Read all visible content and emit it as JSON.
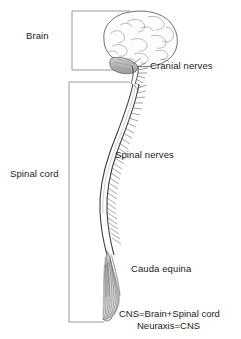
{
  "figure": {
    "background_color": "#ffffff",
    "ink_color": "#1b1b1b",
    "width": 241,
    "height": 339
  },
  "labels": {
    "brain": "Brain",
    "cranial_nerves": "Cranial nerves",
    "spinal_cord": "Spinal cord",
    "spinal_nerves": "Spinal nerves",
    "cauda_equina": "Cauda equina"
  },
  "summary": {
    "line1": "CNS=Brain+Spinal cord",
    "line2": "Neuraxis=CNS"
  },
  "brackets": [
    {
      "name": "brain-bracket",
      "label_ref": "brain",
      "top": 11,
      "bottom": 70,
      "x": 72,
      "arm": 58
    },
    {
      "name": "spinal-cord-bracket",
      "label_ref": "spinal_cord",
      "top": 82,
      "bottom": 322,
      "x": 69,
      "arm": 61
    }
  ],
  "anatomy": {
    "brain": {
      "name": "cerebrum-with-gyri",
      "shading": "hatched-outline",
      "cerebellum": "shaded-gray"
    },
    "brainstem": {
      "name": "brainstem",
      "cranial_nerve_count": 8
    },
    "spinal_cord": {
      "name": "spinal-cord-curve",
      "nerve_pair_count": 31
    },
    "cauda_equina": {
      "name": "cauda-equina-fibers",
      "fiber_count": 14
    }
  }
}
